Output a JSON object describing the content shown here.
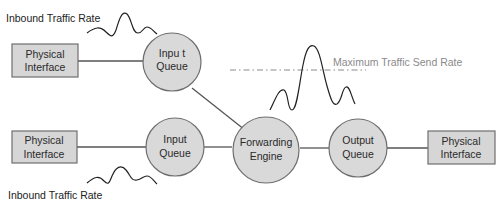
{
  "diagram": {
    "nodes": {
      "phys_top": {
        "label_line1": "Physical",
        "label_line2": "Interface"
      },
      "inq_top": {
        "label_line1": "Inpu t",
        "label_line2": "Queue"
      },
      "phys_bottom": {
        "label_line1": "Physical",
        "label_line2": "Interface"
      },
      "inq_bottom": {
        "label_line1": "Input",
        "label_line2": "Queue"
      },
      "forwarding": {
        "label_line1": "Forwarding",
        "label_line2": "Engine"
      },
      "outq": {
        "label_line1": "Output",
        "label_line2": "Queue"
      },
      "phys_right": {
        "label_line1": "Physical",
        "label_line2": "Interface"
      }
    },
    "annotations": {
      "inbound_top": "Inbound Traffic Rate",
      "inbound_bottom": "Inbound Traffic Rate",
      "max_send_rate": "Maximum Traffic Send Rate"
    },
    "edges": [
      {
        "from": "Physical Interface (top)",
        "to": "Input Queue (top)"
      },
      {
        "from": "Input Queue (top)",
        "to": "Forwarding Engine"
      },
      {
        "from": "Physical Interface (bottom)",
        "to": "Input Queue (bottom)"
      },
      {
        "from": "Input Queue (bottom)",
        "to": "Forwarding Engine"
      },
      {
        "from": "Forwarding Engine",
        "to": "Output Queue"
      },
      {
        "from": "Output Queue",
        "to": "Physical Interface (right)"
      }
    ],
    "colors": {
      "node_fill": "#d9d9d9",
      "node_stroke": "#6e6e6e",
      "threshold_line": "#8a8a8a"
    }
  }
}
